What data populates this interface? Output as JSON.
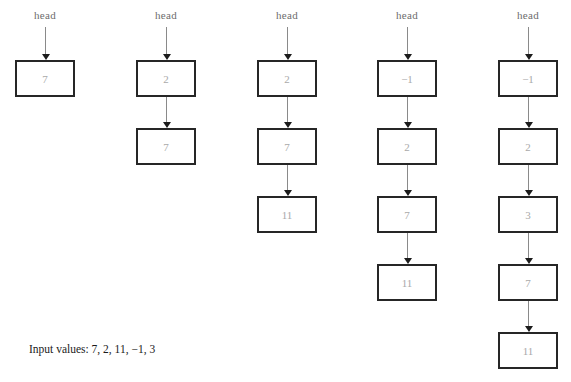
{
  "figure": {
    "caption": "Input values: 7, 2, 11, −1, 3",
    "head_label": "head",
    "accent_border_color": "#262626",
    "value_text_color": "#a9a9a9",
    "arrow_color": "#8a8a8a",
    "arrowhead_color": "#1c1c1c"
  },
  "columns": [
    {
      "name": "step-1",
      "head": "head",
      "nodes": [
        {
          "value": "7"
        }
      ]
    },
    {
      "name": "step-2",
      "head": "head",
      "nodes": [
        {
          "value": "2"
        },
        {
          "value": "7"
        }
      ]
    },
    {
      "name": "step-3",
      "head": "head",
      "nodes": [
        {
          "value": "2"
        },
        {
          "value": "7"
        },
        {
          "value": "11"
        }
      ]
    },
    {
      "name": "step-4",
      "head": "head",
      "nodes": [
        {
          "value": "−1"
        },
        {
          "value": "2"
        },
        {
          "value": "7"
        },
        {
          "value": "11"
        }
      ]
    },
    {
      "name": "step-5",
      "head": "head",
      "nodes": [
        {
          "value": "−1"
        },
        {
          "value": "2"
        },
        {
          "value": "3"
        },
        {
          "value": "7"
        },
        {
          "value": "11"
        }
      ]
    }
  ],
  "layout": {
    "column_left": [
      0,
      121,
      242,
      362,
      483
    ],
    "box_top_first": 60,
    "box_pitch": 68,
    "box_width": 60,
    "box_height": 37
  }
}
